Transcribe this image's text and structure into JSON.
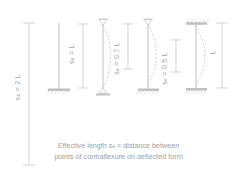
{
  "diagram": {
    "line_color": "#b4b4b4",
    "text_color": "#9e9e9e",
    "caption": {
      "line1": "Effective length s",
      "line1_sub": "e",
      "line1_rest": " = distance between",
      "line2": "points of contraflexure on deflected form"
    },
    "columns": [
      {
        "id": "cantilever",
        "symbol": "s",
        "subscript": "e",
        "equals": " = 2 L",
        "label": "s_e = 2 L",
        "top_restraint": "free",
        "base_restraint": "fixed",
        "dimension_label": "2 L",
        "has_deflected_curve": false
      },
      {
        "id": "pinned-pinned",
        "symbol": "s",
        "subscript": "e",
        "equals": " = L",
        "label": "s_e = L",
        "top_restraint": "pinned",
        "base_restraint": "pinned",
        "dimension_label": "L",
        "has_deflected_curve": true
      },
      {
        "id": "pinned-fixed",
        "symbol": "s",
        "subscript": "e",
        "equals": " = 0.7 L",
        "label": "s_e = 0.7 L",
        "top_restraint": "pinned",
        "base_restraint": "fixed",
        "dimension_label": "0.7 L",
        "has_deflected_curve": true
      },
      {
        "id": "fixed-fixed",
        "symbol": "s",
        "subscript": "e",
        "equals": " = 0.5 L",
        "label": "s_e = 0.5 L",
        "top_restraint": "fixed",
        "base_restraint": "fixed",
        "dimension_label": "0.5 L",
        "has_deflected_curve": true
      }
    ],
    "overall_dimension": {
      "label": "L",
      "description": "actual column length"
    }
  }
}
